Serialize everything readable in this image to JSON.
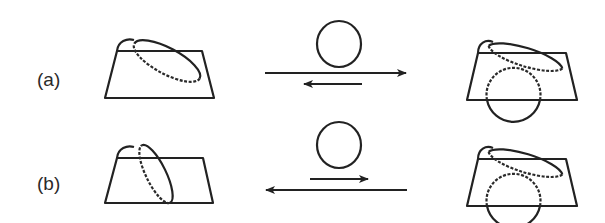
{
  "diagram": {
    "rows": [
      {
        "id": "a",
        "label": "(a)",
        "description": "Ellipse (loop) tilted shallowly over trapezoid block; long arrow right, short arrow left; detached circle above arrows; result shows circle sitting through trapezoid bottom with ellipse draped on top",
        "arrows": [
          {
            "direction": "right",
            "length": "long"
          },
          {
            "direction": "left",
            "length": "short"
          }
        ]
      },
      {
        "id": "b",
        "label": "(b)",
        "description": "Ellipse (loop) tilted steeply over trapezoid block; short arrow right, long arrow left; detached circle above arrows; result shows circle sitting through trapezoid bottom with ellipse draped on top",
        "arrows": [
          {
            "direction": "right",
            "length": "short"
          },
          {
            "direction": "left",
            "length": "long"
          }
        ]
      }
    ],
    "colors": {
      "stroke": "#222222",
      "background": "#ffffff"
    }
  }
}
